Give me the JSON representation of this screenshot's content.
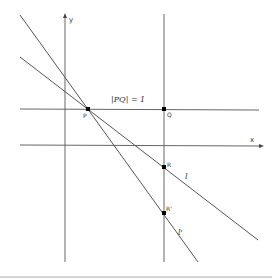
{
  "diagram": {
    "axes": {
      "x_label": "x",
      "y_label": "y"
    },
    "points": {
      "P": {
        "label": "P",
        "x": 88,
        "y": 109
      },
      "Q": {
        "label": "Q",
        "x": 164,
        "y": 109
      },
      "R": {
        "label": "R",
        "x": 164,
        "y": 167
      },
      "R_prime": {
        "label": "R'",
        "x": 164,
        "y": 213
      }
    },
    "annotation": "|PQ| = 1",
    "lines": {
      "l": {
        "label": "l"
      },
      "l_prime": {
        "label": "l'"
      }
    },
    "colors": {
      "line": "#555555",
      "point": "#000000",
      "text": "#333333"
    }
  }
}
